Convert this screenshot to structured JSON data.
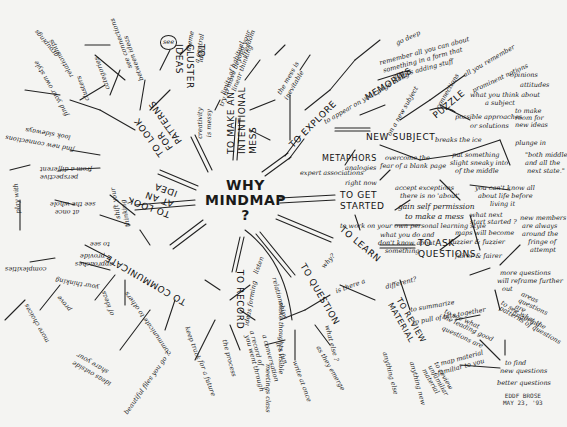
{
  "mindmap": {
    "center": {
      "line1": "WHY",
      "line2": "MINDMAP",
      "line3": "?"
    },
    "branches": {
      "explore": {
        "label": "TO EXPLORE"
      },
      "new_subject": {
        "label": "NEW SUBJECT"
      },
      "memories": {
        "label": "MEMORIES"
      },
      "puzzle": {
        "label": "PUZZLE"
      },
      "metaphors": {
        "label": "METAPHORS"
      },
      "get_started": {
        "label": "TO GET STARTED"
      },
      "learn": {
        "label": "TO LEARN"
      },
      "ask_questions": {
        "label": "TO ASK QUESTIONS"
      },
      "question": {
        "label": "TO QUESTION"
      },
      "record": {
        "label": "TO RECORD"
      },
      "communicate": {
        "label": "TO COMMUNICATE"
      },
      "look_at_idea": {
        "label": "TO LOOK AT AN IDEA"
      },
      "look_for_patterns": {
        "label": "TO LOOK FOR PATTERNS"
      },
      "cluster_ideas": {
        "label": "TO CLUSTER IDEAS"
      },
      "make_mess": {
        "label": "TO MAKE AN INTENTIONAL MESS"
      },
      "review_material": {
        "label": "TO REVIEW MATERIAL"
      }
    },
    "leaves": {
      "go_deep": "go deep",
      "remember_all": "remember all you can about",
      "something_form": "something in a form that",
      "allows_adding": "allows adding stuff",
      "all_you_remember": "all you remember",
      "prominent_notions": "prominent notions",
      "opinions": "opinions",
      "attitudes": "attitudes",
      "what_you_think": "what you think about",
      "a_subject": "a subject",
      "possible_approaches": "possible approaches",
      "or_solutions": "or solutions",
      "to_make_room": "to make room for new ideas",
      "connections": "connections",
      "or_new_subject": "on a new subject",
      "to_appear_on_page": "to appear on your page along",
      "overcome": "overcome the",
      "fear_blank_page": "fear of a blank page",
      "breaks_ice": "breaks the ice",
      "put_something": "put something",
      "slight_sneaky": "slight sneaky into",
      "of_the_middle": "of the middle",
      "plunge_in": "plunge in",
      "both_middle": "\"both middle",
      "and_all_the": "and all the",
      "next_state": "next state.\"",
      "know_all_about": "you can't know all",
      "about_life": "about life before",
      "living_it": "living it",
      "what_next": "what next start started ?",
      "right_now": "right now",
      "expert_associations": "expert associations",
      "analogies": "analogies",
      "accept_exceptions": "accept exceptions",
      "there_is_no_about": "there is no 'about'",
      "gain_permission": "gain self permission",
      "to_make_mess": "to make a mess",
      "own_learning": "to work on your own personal learning style",
      "what_you_do": "what you do and",
      "dont_know": "don't know about",
      "something": "something",
      "maps_will_become": "maps will become",
      "fuzzier": "fuzzier & fuzzier",
      "fairer": "fairer & fairer",
      "new_members": "new members",
      "are_always": "are always",
      "around_the": "around the",
      "fringe": "fringe of",
      "attempt": "attempt",
      "more_questions": "more questions",
      "will_reframe": "will reframe further",
      "out": "out",
      "see_what_leading": "to see what",
      "the_leading": "the leading good",
      "questions_are": "questions are",
      "see_patterns": "to see what the",
      "patterns_of_q": "patterns of questions",
      "areas_questions": "areas questions are lingering",
      "find_new_q": "to find",
      "new_questions": "new questions",
      "better_questions": "better questions",
      "map_material": "map material",
      "familiar_to_you": "familiar to you",
      "is_there_a": "is there a",
      "different": "different?",
      "to_summarize": "to summarize",
      "to_pull_bits": "to pull of bits together",
      "why": "why?",
      "review_material_unfam": "to review unfamiliar material",
      "anything_else": "anything else",
      "anything_new": "anything new",
      "what_else": "what else ?",
      "its_fun": "it's fun",
      "write_at_once": "write at once",
      "as_they_emerge": "as they emerge",
      "thoughts_visible": "make thoughts visible",
      "listen": "listen",
      "ideas_forming": "ideas forming",
      "relationships": "relationships",
      "the_process": "the process",
      "you_went_through": "you went through",
      "keep_track": "keep track",
      "for_future": "for a future",
      "record_of": "a record of",
      "a_conversation": "a conversation",
      "meetings_class": "meetings class",
      "beautiful_files": "beautiful files you go ?",
      "communicate_ideas": "communicate to others",
      "share_your": "share your",
      "ideas_outside": "ideas outside",
      "provide": "provide",
      "approaches": "approaches",
      "to_see": "to see",
      "complexities": "complexities",
      "your_thinking": "your thinking",
      "prove": "prove",
      "more_choices": "more choices",
      "of_ideas": "of ideas",
      "from_different": "from a different",
      "perspective": "perspective",
      "see_the_whole": "see the whole",
      "at_once": "at once",
      "shift_your": "shift your",
      "thinking": "thinking",
      "play_with": "play with",
      "find_connections": "find new connections",
      "look_sideways": "look sideways",
      "find_your": "find your own style",
      "clusters": "clusters",
      "categories": "categories",
      "relationships2": "relationships",
      "groupings": "groupings",
      "see_connections": "see connections",
      "between_ideas": "between ideas",
      "circle_note": "see",
      "theme": "theme",
      "a_central": "a central",
      "idea": "idea",
      "mess_reason1": "try to move beyond your",
      "mess_reason2": "limits of habitual",
      "mess_reason3": "linear thinking",
      "creativity": "creativity",
      "is_messy": "is messy",
      "freedom": "freedom",
      "the_mess": "the mess is",
      "inevitable": "inevitable"
    },
    "signature": {
      "line1": "EDDF BROSE",
      "line2": "MAY 23, '93"
    }
  }
}
